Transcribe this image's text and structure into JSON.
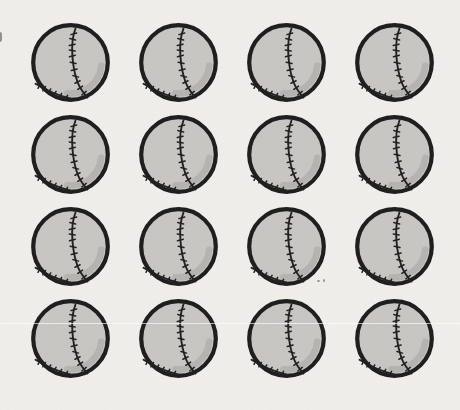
{
  "scene": {
    "description": "Grid of identical cartoon baseball drawings on speckled paper",
    "object": "baseball",
    "count": 16
  },
  "grid": {
    "rows": 4,
    "columns": 4,
    "count": 16,
    "item_name": "baseball",
    "item_icon": "baseball-icon"
  },
  "colors": {
    "background": "#f2f1ee",
    "ball_fill": "#c9c8c4",
    "ball_outline": "#1b1b1b",
    "seam": "#1e1e1e",
    "shading": "#b3b2ae"
  }
}
